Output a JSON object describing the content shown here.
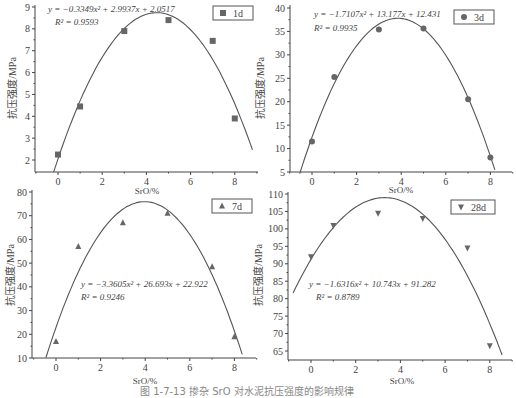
{
  "caption": "图 1-7-13  掺杂 SrO 对水泥抗压强度的影响规律",
  "chart_data": [
    {
      "type": "scatter",
      "id": "1d",
      "legend": "1d",
      "marker": "square",
      "x": [
        0,
        1,
        3,
        5,
        7,
        8
      ],
      "y": [
        2.25,
        4.45,
        7.9,
        8.4,
        7.45,
        3.9
      ],
      "fit": {
        "a": -0.3349,
        "b": 2.9937,
        "c": 2.0517,
        "x_range": [
          -0.2,
          8.8
        ]
      },
      "equation": "y = −0.3349x² + 2.9937x + 2.0517",
      "r2": "R² = 0.9593",
      "xlabel": "SrO/%",
      "ylabel": "抗压强度/MPa",
      "xticks": [
        0,
        2,
        4,
        6,
        8
      ],
      "yticks": [
        2,
        3,
        4,
        5,
        6,
        7,
        8,
        9
      ],
      "xlim": [
        -1,
        9
      ],
      "ylim": [
        1.5,
        9
      ]
    },
    {
      "type": "scatter",
      "id": "3d",
      "legend": "3d",
      "marker": "circle",
      "x": [
        0,
        1,
        3,
        5,
        7,
        8
      ],
      "y": [
        11.5,
        25.3,
        35.4,
        35.6,
        20.5,
        8.1
      ],
      "fit": {
        "a": -1.7107,
        "b": 13.177,
        "c": 12.431,
        "x_range": [
          -0.55,
          8.2
        ]
      },
      "equation": "y = −1.7107x² + 13.177x + 12.431",
      "r2": "R² = 0.9935",
      "xlabel": "SrO/%",
      "ylabel": "抗压强度/MPa",
      "xticks": [
        0,
        2,
        4,
        6,
        8
      ],
      "yticks": [
        5,
        10,
        15,
        20,
        25,
        30,
        35,
        40
      ],
      "xlim": [
        -1,
        9
      ],
      "ylim": [
        5,
        40
      ]
    },
    {
      "type": "scatter",
      "id": "7d",
      "legend": "7d",
      "marker": "triangle-up",
      "x": [
        0,
        1,
        3,
        5,
        7,
        8
      ],
      "y": [
        17,
        57,
        67,
        71,
        48.5,
        19
      ],
      "fit": {
        "a": -3.3605,
        "b": 26.693,
        "c": 22.922,
        "x_range": [
          -0.45,
          8.35
        ]
      },
      "equation": "y = −3.3605x² + 26.693x + 22.922",
      "r2": "R² = 0.9246",
      "xlabel": "SrO/%",
      "ylabel": "抗压强度/MPa",
      "xticks": [
        0,
        2,
        4,
        6,
        8
      ],
      "yticks": [
        10,
        20,
        30,
        40,
        50,
        60,
        70,
        80
      ],
      "xlim": [
        -1,
        9
      ],
      "ylim": [
        10,
        80
      ]
    },
    {
      "type": "scatter",
      "id": "28d",
      "legend": "28d",
      "marker": "triangle-down",
      "x": [
        0,
        1,
        3,
        5,
        7,
        8
      ],
      "y": [
        92,
        101,
        104.5,
        103,
        94.5,
        66.5
      ],
      "fit": {
        "a": -1.6316,
        "b": 10.743,
        "c": 91.282,
        "x_range": [
          -0.8,
          8.55
        ]
      },
      "equation": "y = −1.6316x² + 10.743x + 91.282",
      "r2": "R² = 0.8789",
      "xlabel": "SrO/%",
      "ylabel": "抗压强度/MPa",
      "xticks": [
        0,
        2,
        4,
        6,
        8
      ],
      "yticks": [
        65,
        70,
        75,
        80,
        85,
        90,
        95,
        100,
        105,
        110
      ],
      "xlim": [
        -1,
        9
      ],
      "ylim": [
        62.5,
        110
      ]
    }
  ],
  "layout": [
    {
      "x0px": 58,
      "pxPerX": 22.1,
      "yTopVal": 9,
      "yTopPx": 7,
      "yBotVal": 2,
      "yBotPx": 160,
      "axisLeft": 35,
      "axisRight": 258,
      "axisBottom": 172,
      "axisTop": 5,
      "legend": {
        "x": 213,
        "y": 6,
        "w": 40,
        "h": 14
      },
      "eq": {
        "x": 48,
        "y": 12
      },
      "r2pos": {
        "x": 55,
        "y": 25
      },
      "xlabelPos": {
        "x": 147,
        "y": 194
      },
      "ylabelPos": {
        "x": 16,
        "y": 88
      }
    },
    {
      "x0px": 312,
      "pxPerX": 22.3,
      "yTopVal": 40,
      "yTopPx": 8,
      "yBotVal": 5,
      "yBotPx": 172,
      "axisLeft": 290,
      "axisRight": 512,
      "axisBottom": 172,
      "axisTop": 5,
      "legend": {
        "x": 454,
        "y": 10,
        "w": 40,
        "h": 14
      },
      "eq": {
        "x": 314,
        "y": 17
      },
      "r2pos": {
        "x": 314,
        "y": 31
      },
      "xlabelPos": {
        "x": 401,
        "y": 193
      },
      "ylabelPos": {
        "x": 264,
        "y": 88
      }
    },
    {
      "x0px": 56,
      "pxPerX": 22.3,
      "yTopVal": 80,
      "yTopPx": 192,
      "yBotVal": 10,
      "yBotPx": 358,
      "axisLeft": 32,
      "axisRight": 256,
      "axisBottom": 358,
      "axisTop": 190,
      "legend": {
        "x": 212,
        "y": 199,
        "w": 40,
        "h": 14
      },
      "eq": {
        "x": 81,
        "y": 287
      },
      "r2pos": {
        "x": 81,
        "y": 300
      },
      "xlabelPos": {
        "x": 145,
        "y": 384
      },
      "ylabelPos": {
        "x": 14,
        "y": 275
      }
    },
    {
      "x0px": 311,
      "pxPerX": 22.35,
      "yTopVal": 110,
      "yTopPx": 194,
      "yBotVal": 65,
      "yBotPx": 351,
      "axisLeft": 288,
      "axisRight": 512,
      "axisBottom": 360,
      "axisTop": 192,
      "legend": {
        "x": 451,
        "y": 200,
        "w": 44,
        "h": 14
      },
      "eq": {
        "x": 309,
        "y": 287
      },
      "r2pos": {
        "x": 316,
        "y": 300
      },
      "xlabelPos": {
        "x": 402,
        "y": 384
      },
      "ylabelPos": {
        "x": 262,
        "y": 275
      }
    }
  ]
}
